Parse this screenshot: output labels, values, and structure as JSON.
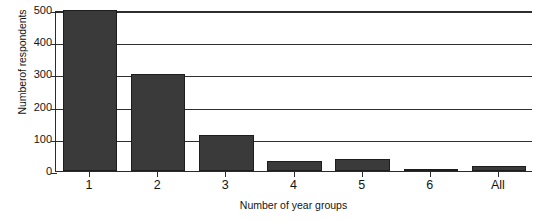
{
  "chart_data": {
    "type": "bar",
    "title": "",
    "subtitle": "",
    "xlabel": "Number of year groups",
    "ylabel": "Numberof respondents",
    "categories": [
      "1",
      "2",
      "3",
      "4",
      "5",
      "6",
      "All"
    ],
    "values": [
      500,
      302,
      113,
      31,
      36,
      5,
      17
    ],
    "series": [
      {
        "name": "Number of respondents",
        "values": [
          500,
          302,
          113,
          31,
          36,
          5,
          17
        ]
      }
    ],
    "ylim": [
      0,
      500
    ],
    "yticks": [
      0,
      100,
      200,
      300,
      400,
      500
    ],
    "ytick_labels": [
      "0",
      "100",
      "200",
      "300",
      "400",
      "500"
    ],
    "grid": "horizontal",
    "legend": "none",
    "bar_color": "#3a3a3a",
    "bar_edge_color": "#1d1d1d",
    "axis_color": "#2b2b2b",
    "background": "#ffffff"
  },
  "figure": {
    "caption_partial": ""
  }
}
